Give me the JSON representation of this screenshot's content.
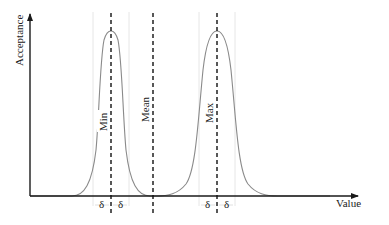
{
  "axes": {
    "y_label": "Acceptance",
    "x_label": "Value"
  },
  "markers": [
    {
      "id": "min",
      "label": "Min",
      "x": 111
    },
    {
      "id": "mean",
      "label": "Mean",
      "x": 153
    },
    {
      "id": "max",
      "label": "Max",
      "x": 217
    }
  ],
  "tolerance": {
    "symbol": "δ",
    "min_left": "δ",
    "min_right": "δ",
    "max_left": "δ",
    "max_right": "δ"
  },
  "curves": [
    {
      "name": "acceptance-around-min",
      "center_marker": "Min"
    },
    {
      "name": "acceptance-around-max",
      "center_marker": "Max"
    }
  ],
  "colors": {
    "axis": "#1a1a1a",
    "curve": "#8a8a8a",
    "dashed_marker": "#111111",
    "guide": "#e6e6e6"
  }
}
